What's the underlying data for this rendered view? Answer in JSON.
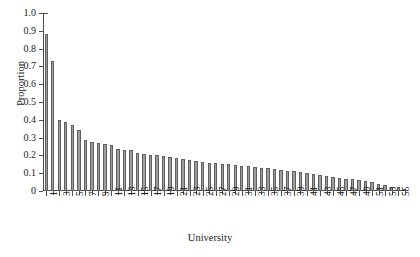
{
  "chart_data": {
    "type": "bar",
    "title": "",
    "subtitle": "",
    "xlabel": "University",
    "ylabel": "Proportion",
    "xlim": [
      0.5,
      56.5
    ],
    "ylim": [
      0,
      1.0
    ],
    "grid": false,
    "legend": null,
    "bar_color": "#9d9d9d",
    "bar_edge_color": "#5f5f5f",
    "axis_color": "#4d4d4d",
    "y_ticks": [
      0,
      0.1,
      0.2,
      0.3,
      0.4,
      0.5,
      0.6,
      0.7,
      0.8,
      0.9,
      1.0
    ],
    "y_tick_labels": [
      "0",
      "0.1",
      "0.2",
      "0.3",
      "0.4",
      "0.5",
      "0.6",
      "0.7",
      "0.8",
      "0.9",
      "1.0"
    ],
    "x_tick_labels": [
      "1",
      "3",
      "5",
      "7",
      "9",
      "11",
      "13",
      "15",
      "17",
      "19",
      "21",
      "23",
      "25",
      "27",
      "29",
      "31",
      "33",
      "35",
      "37",
      "39",
      "41",
      "43",
      "45",
      "47",
      "49",
      "51",
      "53",
      "55"
    ],
    "x_tick_label_rotation": 90,
    "categories": [
      1,
      2,
      3,
      4,
      5,
      6,
      7,
      8,
      9,
      10,
      11,
      12,
      13,
      14,
      15,
      16,
      17,
      18,
      19,
      20,
      21,
      22,
      23,
      24,
      25,
      26,
      27,
      28,
      29,
      30,
      31,
      32,
      33,
      34,
      35,
      36,
      37,
      38,
      39,
      40,
      41,
      42,
      43,
      44,
      45,
      46,
      47,
      48,
      49,
      50,
      51,
      52,
      53,
      54,
      55,
      56
    ],
    "values": [
      0.88,
      0.73,
      0.4,
      0.385,
      0.37,
      0.34,
      0.285,
      0.275,
      0.27,
      0.265,
      0.26,
      0.235,
      0.23,
      0.23,
      0.215,
      0.21,
      0.205,
      0.2,
      0.195,
      0.19,
      0.185,
      0.18,
      0.175,
      0.17,
      0.165,
      0.16,
      0.155,
      0.15,
      0.15,
      0.145,
      0.14,
      0.14,
      0.135,
      0.13,
      0.13,
      0.125,
      0.12,
      0.115,
      0.11,
      0.105,
      0.1,
      0.095,
      0.09,
      0.085,
      0.08,
      0.075,
      0.07,
      0.065,
      0.06,
      0.055,
      0.05,
      0.04,
      0.035,
      0.025,
      0.02,
      0.01
    ]
  }
}
